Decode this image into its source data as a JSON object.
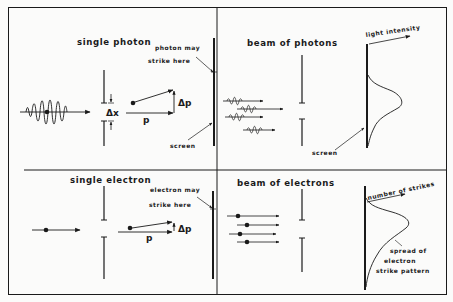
{
  "figure": {
    "panels": {
      "single_photon": {
        "title": "single photon",
        "delta_x_label": "Δx",
        "p_label": "p",
        "delta_p_label": "Δp",
        "strike_label_line1": "photon may",
        "strike_label_line2": "strike here",
        "screen_label": "screen"
      },
      "beam_of_photons": {
        "title": "beam of photons",
        "axis_label": "light intensity",
        "screen_label": "screen"
      },
      "single_electron": {
        "title": "single electron",
        "p_label": "p",
        "delta_p_label": "Δp",
        "strike_label_line1": "electron may",
        "strike_label_line2": "strike here"
      },
      "beam_of_electrons": {
        "title": "beam of electrons",
        "axis_label": "number of strikes",
        "spread_label_line1": "spread of",
        "spread_label_line2": "electron",
        "spread_label_line3": "strike pattern"
      }
    },
    "colors": {
      "ink": "#1a1a1a",
      "paper": "#fbfbfa"
    }
  }
}
